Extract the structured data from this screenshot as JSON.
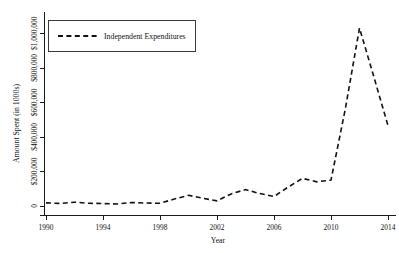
{
  "chart_data": {
    "type": "line",
    "title": "",
    "xlabel": "Year",
    "ylabel": "Amount Spent (in 1000s)",
    "xlim": [
      1990,
      2014
    ],
    "ylim": [
      0,
      1100000
    ],
    "grid": false,
    "legend_position": "top-left",
    "x_tick_labels": [
      "1990",
      "1994",
      "1998",
      "2002",
      "2006",
      "2010",
      "2014"
    ],
    "x_tick_values": [
      1990,
      1994,
      1998,
      2002,
      2006,
      2010,
      2014
    ],
    "y_tick_labels": [
      "0",
      "$200,000",
      "$400,000",
      "$600,000",
      "$800,000",
      "$1,000,000"
    ],
    "y_tick_values": [
      0,
      200000,
      400000,
      600000,
      800000,
      1000000
    ],
    "series": [
      {
        "name": "Independent Expenditures",
        "line_style": "dashed",
        "color": "#111111",
        "x": [
          1990,
          1991,
          1992,
          1993,
          1994,
          1995,
          1996,
          1997,
          1998,
          1999,
          2000,
          2001,
          2002,
          2003,
          2004,
          2005,
          2006,
          2007,
          2008,
          2009,
          2010,
          2011,
          2012,
          2013,
          2014
        ],
        "values": [
          18000,
          15000,
          22000,
          16000,
          14000,
          12000,
          20000,
          17000,
          16000,
          40000,
          62000,
          45000,
          30000,
          70000,
          95000,
          72000,
          55000,
          110000,
          160000,
          140000,
          150000,
          560000,
          1030000,
          750000,
          465000
        ]
      }
    ]
  },
  "legend": {
    "entries": [
      {
        "label": "Independent Expenditures",
        "swatch": "dashed-line-swatch"
      }
    ]
  },
  "axes": {
    "x_title": "Year",
    "y_title": "Amount Spent (in 1000s)"
  }
}
